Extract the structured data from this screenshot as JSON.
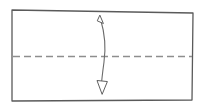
{
  "figure": {
    "title": "Origami valley fold diagram",
    "canvas": {
      "width": 205,
      "height": 110,
      "background": "#ffffff"
    }
  },
  "paper": {
    "name": "paper-sheet",
    "shape": "rectangle",
    "stroke_color": "#5a5a5a",
    "fill_color": "#ffffff",
    "corners": {
      "top_left": [
        12,
        10
      ],
      "top_right": [
        193,
        13
      ],
      "bottom_right": [
        192,
        100
      ],
      "bottom_left": [
        12,
        101
      ]
    }
  },
  "fold_line": {
    "name": "fold-crease-dashed",
    "orientation": "horizontal",
    "style": "dashed",
    "meaning": "valley fold crease",
    "color": "#8e8e8e",
    "start": [
      13,
      56
    ],
    "end": [
      192,
      56
    ],
    "dash_length": 7,
    "gap_length": 4
  },
  "arrow": {
    "name": "fold-unfold-double-arrow",
    "type": "double-headed-curved",
    "meaning": "fold in half and unfold",
    "color": "#6b6b6b",
    "shaft_path": "M 100.5 19 C 105 34 106 48 104 62 C 102.5 73 101.5 82 101 89",
    "head_top": {
      "tip": [
        100.0,
        15.5
      ],
      "points": "100.0,15.5 103.4,23.5 97.6,21.0",
      "filled": false
    },
    "head_bottom": {
      "tip": [
        102.0,
        94.0
      ],
      "points": "102.0,94.0 97.0,80.5 107.0,81.5",
      "filled": false
    }
  },
  "labels": {
    "none_visible": "",
    "figure_caption": ""
  }
}
